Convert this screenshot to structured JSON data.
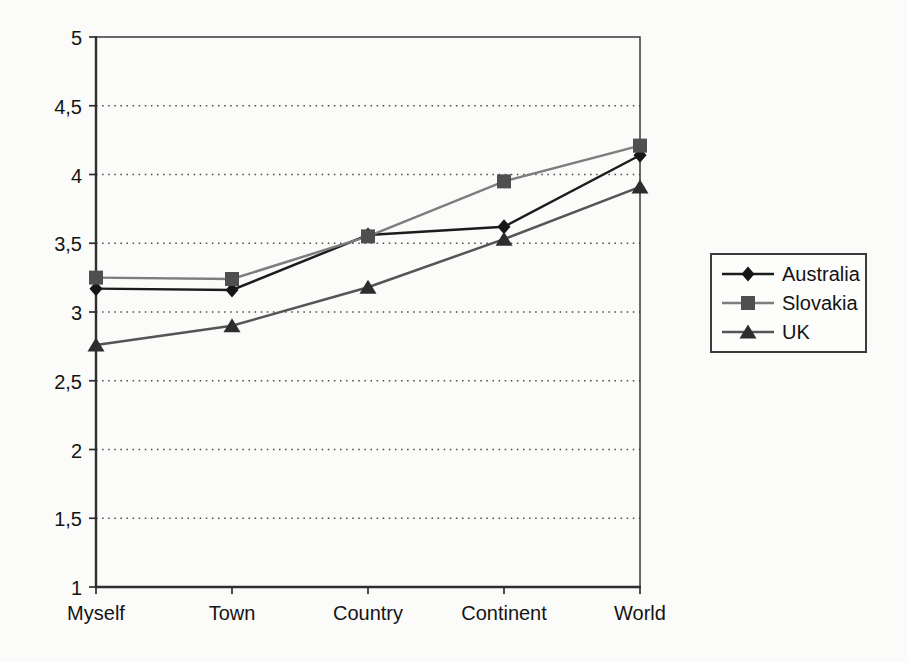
{
  "chart_data": {
    "type": "line",
    "title": "",
    "xlabel": "",
    "ylabel": "",
    "categories": [
      "Myself",
      "Town",
      "Country",
      "Continent",
      "World"
    ],
    "series": [
      {
        "name": "Australia",
        "marker": "diamond",
        "line_color": "#1c1c1c",
        "marker_color": "#161616",
        "values": [
          3.17,
          3.16,
          3.56,
          3.62,
          4.14
        ]
      },
      {
        "name": "Slovakia",
        "marker": "square",
        "line_color": "#7d7d7d",
        "marker_color": "#4f4f4f",
        "values": [
          3.25,
          3.24,
          3.55,
          3.95,
          4.21
        ]
      },
      {
        "name": "UK",
        "marker": "triangle",
        "line_color": "#555555",
        "marker_color": "#2d2d2d",
        "values": [
          2.76,
          2.9,
          3.18,
          3.53,
          3.91
        ]
      }
    ],
    "ylim": [
      1,
      5
    ],
    "ytick_step": 0.5,
    "ytick_labels": [
      "1",
      "1,5",
      "2",
      "2,5",
      "3",
      "3,5",
      "4",
      "4,5",
      "5"
    ],
    "grid": "horizontal-dotted",
    "legend_position": "right",
    "colors": {
      "axis": "#2e2e2e",
      "border": "#3a3a3a",
      "gridline": "#4a4a4a",
      "text": "#141414",
      "background": "#fbfbf9"
    }
  }
}
